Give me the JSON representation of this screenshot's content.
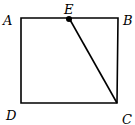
{
  "diagram": {
    "type": "geometry",
    "shape": "square",
    "points": {
      "A": {
        "label": "A",
        "x": 21,
        "y": 18
      },
      "B": {
        "label": "B",
        "x": 118,
        "y": 18
      },
      "C": {
        "label": "C",
        "x": 117,
        "y": 103
      },
      "D": {
        "label": "D",
        "x": 21,
        "y": 103
      },
      "E": {
        "label": "E",
        "x": 69,
        "y": 18
      }
    },
    "segments": [
      "AB",
      "BC",
      "CD",
      "DA",
      "EC"
    ],
    "marked_points": [
      "E"
    ],
    "colors": {
      "stroke": "#000000",
      "background": "#ffffff"
    }
  }
}
